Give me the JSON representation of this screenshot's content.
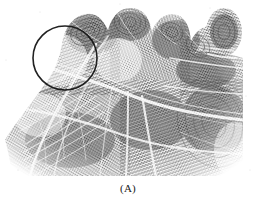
{
  "figure": {
    "kind": "palmprint-photograph",
    "caption": "(A)",
    "annotation": {
      "shape": "circle",
      "label": "region-of-interest",
      "center_x": 65,
      "center_y": 58,
      "radius": 32,
      "stroke_color": "#151515",
      "stroke_width": 1.6
    },
    "colors": {
      "background": "#ffffff",
      "ink_dark": "#3a3a3a",
      "ink_mid": "#7d7d7d",
      "ink_light": "#b9b9b9",
      "crease_white": "#fbfbfb",
      "annotation": "#151515",
      "caption_text": "#1b1b1b"
    },
    "print_bounds": {
      "left": 4,
      "top": 8,
      "right": 243,
      "bottom": 176
    },
    "regions": [
      {
        "name": "finger-base-pad-index",
        "cx": 88,
        "cy": 30
      },
      {
        "name": "finger-base-pad-middle",
        "cx": 128,
        "cy": 22
      },
      {
        "name": "finger-base-pad-ring",
        "cx": 163,
        "cy": 30
      },
      {
        "name": "finger-base-pad-little",
        "cx": 196,
        "cy": 44
      },
      {
        "name": "thumb-impression",
        "cx": 224,
        "cy": 34
      },
      {
        "name": "thenar-eminence",
        "cx": 70,
        "cy": 130
      },
      {
        "name": "hypothenar-eminence",
        "cx": 195,
        "cy": 120
      }
    ],
    "creases": [
      {
        "name": "distal-transverse-crease",
        "role": "major"
      },
      {
        "name": "proximal-transverse-crease",
        "role": "major"
      },
      {
        "name": "thenar-crease",
        "role": "major"
      },
      {
        "name": "hypothenar-crease",
        "role": "minor"
      },
      {
        "name": "wrist-crease",
        "role": "minor"
      }
    ]
  }
}
